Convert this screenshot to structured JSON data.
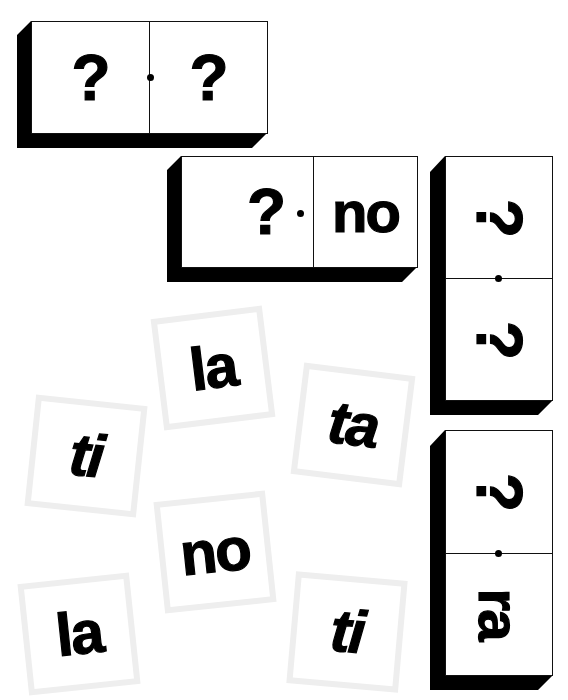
{
  "game": {
    "type": "syllable-domino-puzzle",
    "colors": {
      "background": "#ffffff",
      "domino_face": "#ffffff",
      "domino_outline": "#111111",
      "domino_shadow": "#000000",
      "tile_border": "#eeeeee",
      "text": "#000000"
    }
  },
  "dominoes": [
    {
      "id": "domino-1",
      "orientation": "horizontal",
      "halves": [
        {
          "text": "?",
          "is_slot": true
        },
        {
          "text": "?",
          "is_slot": true
        }
      ]
    },
    {
      "id": "domino-2",
      "orientation": "horizontal",
      "halves": [
        {
          "text": "?",
          "is_slot": true
        },
        {
          "text": "no",
          "is_slot": false
        }
      ]
    },
    {
      "id": "domino-3",
      "orientation": "vertical",
      "halves": [
        {
          "text": "?",
          "is_slot": true
        },
        {
          "text": "?",
          "is_slot": true
        }
      ]
    },
    {
      "id": "domino-4",
      "orientation": "vertical",
      "halves": [
        {
          "text": "?",
          "is_slot": true
        },
        {
          "text": "ra",
          "is_slot": false
        }
      ]
    }
  ],
  "tiles": [
    {
      "text": "la",
      "rotation_deg": -7
    },
    {
      "text": "ti",
      "rotation_deg": 6
    },
    {
      "text": "ta",
      "rotation_deg": 7
    },
    {
      "text": "no",
      "rotation_deg": -6
    },
    {
      "text": "la",
      "rotation_deg": -6
    },
    {
      "text": "ti",
      "rotation_deg": 5
    }
  ]
}
